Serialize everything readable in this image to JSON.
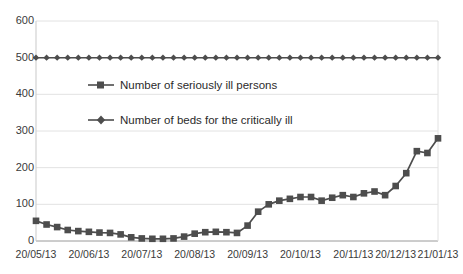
{
  "chart_data": {
    "type": "line",
    "title": "",
    "xlabel": "",
    "ylabel": "",
    "ylim": [
      0,
      600
    ],
    "ytick_values": [
      0,
      100,
      200,
      300,
      400,
      500,
      600
    ],
    "ytick_labels": [
      "0",
      "100",
      "200",
      "300",
      "400",
      "500",
      "600"
    ],
    "xtick_labels": [
      "20/05/13",
      "20/06/13",
      "20/07/13",
      "20/08/13",
      "20/09/13",
      "20/10/13",
      "20/11/13",
      "20/12/13",
      "21/01/13"
    ],
    "xtick_indices": [
      0,
      5,
      10,
      15,
      20,
      25,
      30,
      34,
      38
    ],
    "grid": true,
    "grid_axis": "y",
    "legend_position": "inside-upper-left",
    "n_points": 39,
    "series": [
      {
        "name": "Number of seriously ill persons",
        "marker": "square",
        "color": "#4d4d4d",
        "values": [
          55,
          45,
          38,
          30,
          27,
          25,
          23,
          22,
          18,
          10,
          7,
          6,
          6,
          7,
          12,
          20,
          24,
          25,
          24,
          22,
          42,
          80,
          100,
          110,
          115,
          120,
          120,
          110,
          118,
          125,
          120,
          130,
          135,
          125,
          150,
          185,
          245,
          240,
          280,
          330,
          340,
          380,
          430,
          490,
          520,
          525,
          530
        ]
      },
      {
        "name": "Number of beds for the critically ill",
        "marker": "diamond",
        "color": "#4d4d4d",
        "values": [
          500,
          500,
          500,
          500,
          500,
          500,
          500,
          500,
          500,
          500,
          500,
          500,
          500,
          500,
          500,
          500,
          500,
          500,
          500,
          500,
          500,
          500,
          500,
          500,
          500,
          500,
          500,
          500,
          500,
          500,
          500,
          500,
          500,
          500,
          500,
          500,
          500,
          500,
          500,
          500,
          500,
          500,
          500,
          500,
          500,
          500,
          500
        ]
      }
    ]
  },
  "legend": {
    "items": [
      {
        "label": "Number of seriously ill persons",
        "marker": "square"
      },
      {
        "label": "Number of beds for the critically ill",
        "marker": "diamond"
      }
    ]
  }
}
